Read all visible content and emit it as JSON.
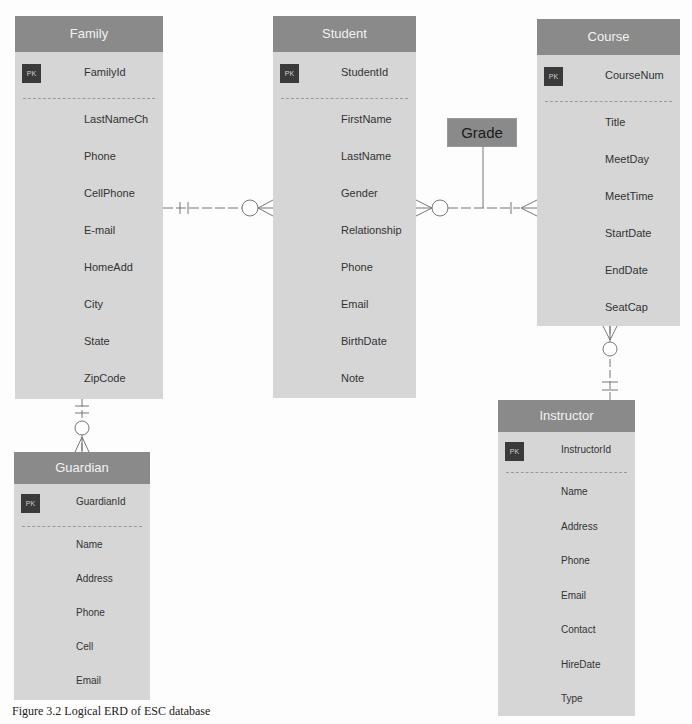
{
  "diagram": {
    "type": "Logical ERD",
    "caption": "Figure 3.2 Logical ERD of ESC database",
    "colors": {
      "header": "#8a8a8a",
      "body": "#d6d6d6",
      "pk_badge": "#3a3a3a",
      "line": "#777777"
    },
    "pk_label": "PK"
  },
  "entities": {
    "family": {
      "name": "Family",
      "pk": "FamilyId",
      "attributes": [
        "LastNameCh",
        "Phone",
        "CellPhone",
        "E-mail",
        "HomeAdd",
        "City",
        "State",
        "ZipCode"
      ]
    },
    "student": {
      "name": "Student",
      "pk": "StudentId",
      "attributes": [
        "FirstName",
        "LastName",
        "Gender",
        "Relationship",
        "Phone",
        "Email",
        "BirthDate",
        "Note"
      ]
    },
    "course": {
      "name": "Course",
      "pk": "CourseNum",
      "attributes": [
        "Title",
        "MeetDay",
        "MeetTime",
        "StartDate",
        "EndDate",
        "SeatCap"
      ]
    },
    "guardian": {
      "name": "Guardian",
      "pk": "GuardianId",
      "attributes": [
        "Name",
        "Address",
        "Phone",
        "Cell",
        "Email"
      ]
    },
    "instructor": {
      "name": "Instructor",
      "pk": "InstructorId",
      "attributes": [
        "Name",
        "Address",
        "Phone",
        "Email",
        "Contact",
        "HireDate",
        "Type"
      ]
    }
  },
  "associative": {
    "grade": "Grade"
  },
  "relationships": [
    {
      "from": "Family",
      "to": "Student",
      "from_card": "one and only one",
      "to_card": "zero or many"
    },
    {
      "from": "Student",
      "to": "Course",
      "to_card": "one or many",
      "from_card": "zero or many",
      "via": "Grade"
    },
    {
      "from": "Family",
      "to": "Guardian",
      "from_card": "one and only one",
      "to_card": "zero or many"
    },
    {
      "from": "Instructor",
      "to": "Course",
      "from_card": "one and only one",
      "to_card": "zero or many"
    }
  ]
}
